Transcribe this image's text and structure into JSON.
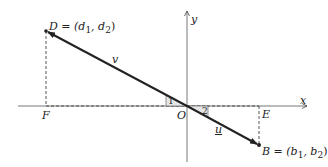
{
  "diagram": {
    "type": "vector-diagram",
    "axes": {
      "x_label": "x",
      "y_label": "y",
      "origin_label": "O"
    },
    "points": {
      "D": {
        "label": "D = (d",
        "sub1": "1",
        "mid": ", d",
        "sub2": "2",
        "end": ")"
      },
      "B": {
        "label": "B = (b",
        "sub1": "1",
        "mid": ", b",
        "sub2": "2",
        "end": ")"
      },
      "F": {
        "label": "F"
      },
      "E": {
        "label": "E"
      }
    },
    "vectors": {
      "v": {
        "label": "v"
      },
      "u": {
        "label": "u"
      }
    },
    "angles": {
      "angle1": {
        "label": "1"
      },
      "angle2": {
        "label": "2"
      }
    },
    "colors": {
      "line": "#222222",
      "axis": "#555555",
      "dashed": "#444444"
    }
  }
}
